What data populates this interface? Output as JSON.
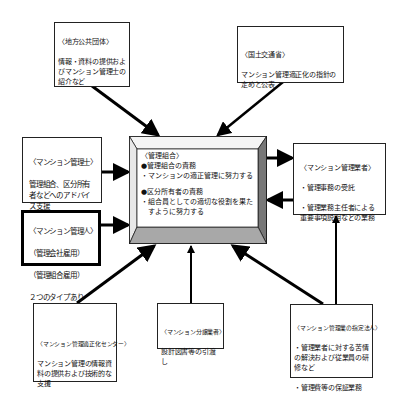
{
  "diagram": {
    "center": {
      "title": "〈管理組合〉",
      "sections": [
        {
          "heading": "●管理組合の責務",
          "items": [
            "・マンションの適正管理に努力する"
          ]
        },
        {
          "heading": "●区分所有者の責務",
          "items": [
            "・組合員としての適切な役割を果た",
            "　すように努力する"
          ]
        }
      ],
      "bevel_colors": {
        "top": "#f4f4f4",
        "left": "#e8e8e8",
        "right": "#777777",
        "bottom": "#a8a8a8"
      }
    },
    "boxes": {
      "local_government": {
        "title": "〈地方公共団体〉",
        "text": "情報・資料の提供およびマンション管理士の紹介など"
      },
      "mlit": {
        "title": "〈国土交通省〉",
        "text": "マンション管理適正化の指針の定めと公表"
      },
      "condo_manager_consultant": {
        "title": "〈マンション管理士〉",
        "text": "管理組合、区分所有者などへのアドバイス支援"
      },
      "condo_administrator": {
        "title": "〈マンション管理人〉",
        "lines": [
          "（管理会社雇用）",
          "（管理組合雇用）",
          "２つのタイプあり"
        ]
      },
      "management_company": {
        "title": "〈マンション管理業者〉",
        "lines": [
          "・管理事務の受託",
          "・管理業務主任者による重要事項説明などの業務"
        ]
      },
      "management_center": {
        "title": "〈マンション管理適正化センター〉",
        "text": "マンション管理の情報資料の提供および技術的な支援"
      },
      "developer": {
        "title": "〈マンション分譲業者〉",
        "text": "設計図書等の引渡し"
      },
      "designated_corporation": {
        "title": "〈マンション管理業の指定法人〉",
        "lines": [
          "・管理業者に対する苦情の解決および従業員の研修など",
          "・管理費等の保証業務"
        ]
      }
    },
    "colors": {
      "line": "#000000",
      "border": "#222222",
      "background": "#ffffff"
    }
  }
}
